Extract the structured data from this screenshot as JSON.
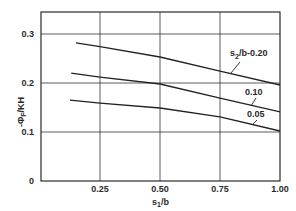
{
  "chart_data": {
    "type": "line",
    "title": "",
    "xlabel": "s1/b",
    "ylabel": "-ΦF/KH",
    "xlim": [
      0,
      1.0
    ],
    "ylim": [
      0,
      0.35
    ],
    "grid": true,
    "x_ticks": [
      "0.25",
      "0.50",
      "0.75",
      "1.00"
    ],
    "y_ticks": [
      "0",
      "0.1",
      "0.2",
      "0.3"
    ],
    "legend_position": "inline labels at right with leader lines",
    "series": [
      {
        "name": "s2/b=0.20",
        "label": "s2/b-0.20",
        "x": [
          0.15,
          0.25,
          0.5,
          0.75,
          1.0
        ],
        "values": [
          0.282,
          0.274,
          0.253,
          0.224,
          0.196
        ]
      },
      {
        "name": "0.10",
        "label": "0.10",
        "x": [
          0.13,
          0.25,
          0.5,
          0.75,
          1.0
        ],
        "values": [
          0.22,
          0.212,
          0.198,
          0.169,
          0.141
        ]
      },
      {
        "name": "0.05",
        "label": "0.05",
        "x": [
          0.125,
          0.25,
          0.5,
          0.75,
          1.0
        ],
        "values": [
          0.165,
          0.159,
          0.149,
          0.131,
          0.102
        ]
      }
    ],
    "colors": {
      "line": "#222222",
      "grid": "#333333",
      "text": "#2a2a2a"
    }
  },
  "axis": {
    "ylabel_main": "-Φ",
    "ylabel_sub": "F",
    "ylabel_tail": "/KH",
    "xlabel_main": "s",
    "xlabel_sub": "1",
    "xlabel_tail": "/b"
  },
  "labels": {
    "series0_main": "s",
    "series0_sub": "2",
    "series0_tail": "/b-0.20",
    "series1": "0.10",
    "series2": "0.05"
  }
}
